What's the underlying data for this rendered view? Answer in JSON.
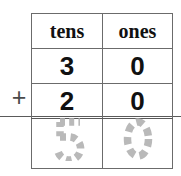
{
  "worksheet": {
    "type": "place-value-addition",
    "operator": "+",
    "table": {
      "columns": [
        "tens",
        "ones"
      ],
      "rows": [
        {
          "kind": "addend",
          "cells": [
            "3",
            "0"
          ]
        },
        {
          "kind": "addend",
          "cells": [
            "2",
            "0"
          ]
        },
        {
          "kind": "answer",
          "cells": [
            "5",
            "0"
          ],
          "style": "traced-dashed"
        }
      ]
    },
    "problem": {
      "addend_one": "30",
      "addend_two": "20",
      "sum": "50"
    },
    "colors": {
      "ink": "#111111",
      "rule": "#6b6b6b",
      "sum_bar": "#5a5a5a",
      "traced": "#b9b9b9",
      "background": "#ffffff"
    }
  }
}
